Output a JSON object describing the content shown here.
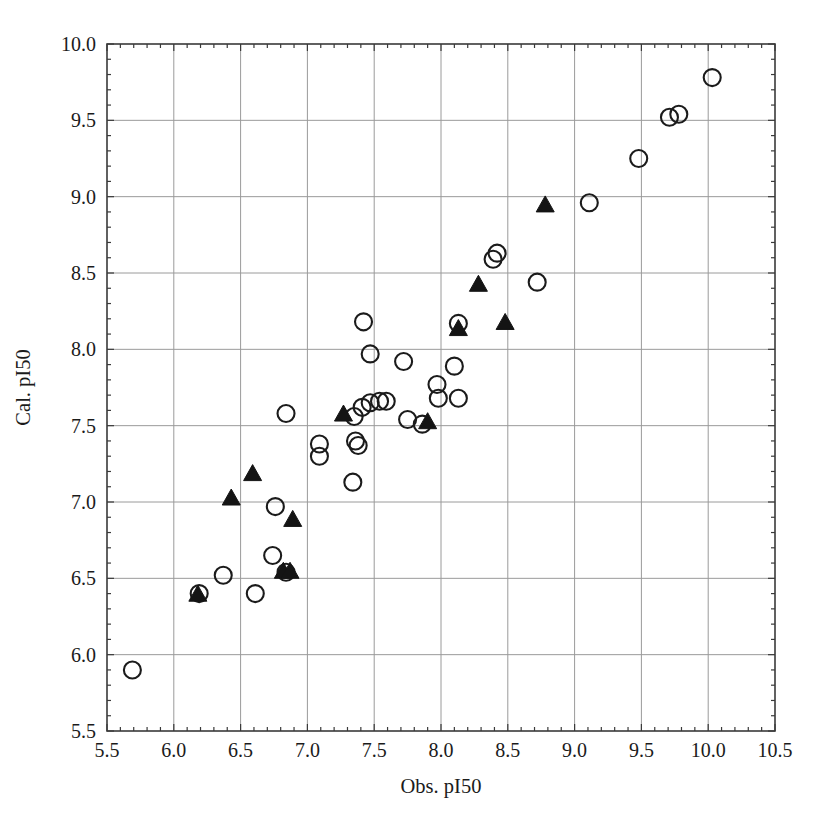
{
  "chart_data": {
    "type": "scatter",
    "title": "",
    "xlabel": "Obs. pI50",
    "ylabel": "Cal. pI50",
    "xlim": [
      5.5,
      10.5
    ],
    "ylim": [
      5.5,
      10.0
    ],
    "xticks": [
      "5.5",
      "6.0",
      "6.5",
      "7.0",
      "7.5",
      "8.0",
      "8.5",
      "9.0",
      "9.5",
      "10.0",
      "10.5"
    ],
    "yticks": [
      "5.5",
      "6.0",
      "6.5",
      "7.0",
      "7.5",
      "8.0",
      "8.5",
      "9.0",
      "9.5",
      "10.0"
    ],
    "xtick_values": [
      5.5,
      6.0,
      6.5,
      7.0,
      7.5,
      8.0,
      8.5,
      9.0,
      9.5,
      10.0,
      10.5
    ],
    "ytick_values": [
      5.5,
      6.0,
      6.5,
      7.0,
      7.5,
      8.0,
      8.5,
      9.0,
      9.5,
      10.0
    ],
    "grid": true,
    "minor_ticks": true,
    "legend": "none",
    "axis_color": "#3a3a3a",
    "grid_color": "#9a9a9a",
    "series": [
      {
        "name": "training-set",
        "marker": "open-circle",
        "color": "#1b1b1b",
        "fill": "none",
        "points": [
          [
            5.69,
            5.9
          ],
          [
            6.19,
            6.4
          ],
          [
            6.37,
            6.52
          ],
          [
            6.61,
            6.4
          ],
          [
            6.74,
            6.65
          ],
          [
            6.76,
            6.97
          ],
          [
            6.84,
            6.54
          ],
          [
            6.84,
            7.58
          ],
          [
            7.09,
            7.38
          ],
          [
            7.09,
            7.3
          ],
          [
            7.34,
            7.13
          ],
          [
            7.35,
            7.56
          ],
          [
            7.36,
            7.4
          ],
          [
            7.38,
            7.37
          ],
          [
            7.41,
            7.62
          ],
          [
            7.42,
            8.18
          ],
          [
            7.47,
            7.65
          ],
          [
            7.47,
            7.97
          ],
          [
            7.54,
            7.66
          ],
          [
            7.59,
            7.66
          ],
          [
            7.72,
            7.92
          ],
          [
            7.75,
            7.54
          ],
          [
            7.86,
            7.51
          ],
          [
            7.97,
            7.77
          ],
          [
            7.98,
            7.68
          ],
          [
            8.1,
            7.89
          ],
          [
            8.13,
            7.68
          ],
          [
            8.13,
            8.17
          ],
          [
            8.39,
            8.59
          ],
          [
            8.42,
            8.63
          ],
          [
            8.72,
            8.44
          ],
          [
            9.11,
            8.96
          ],
          [
            9.48,
            9.25
          ],
          [
            9.71,
            9.52
          ],
          [
            9.78,
            9.54
          ],
          [
            10.03,
            9.78
          ]
        ]
      },
      {
        "name": "test-set",
        "marker": "filled-triangle",
        "color": "#141414",
        "fill": "#141414",
        "points": [
          [
            6.18,
            6.39
          ],
          [
            6.43,
            7.02
          ],
          [
            6.59,
            7.18
          ],
          [
            6.82,
            6.54
          ],
          [
            6.87,
            6.54
          ],
          [
            6.89,
            6.88
          ],
          [
            7.27,
            7.57
          ],
          [
            7.9,
            7.52
          ],
          [
            8.13,
            8.13
          ],
          [
            8.28,
            8.42
          ],
          [
            8.48,
            8.17
          ],
          [
            8.78,
            8.94
          ]
        ]
      }
    ]
  },
  "figure": {
    "caption_fragment": ""
  }
}
